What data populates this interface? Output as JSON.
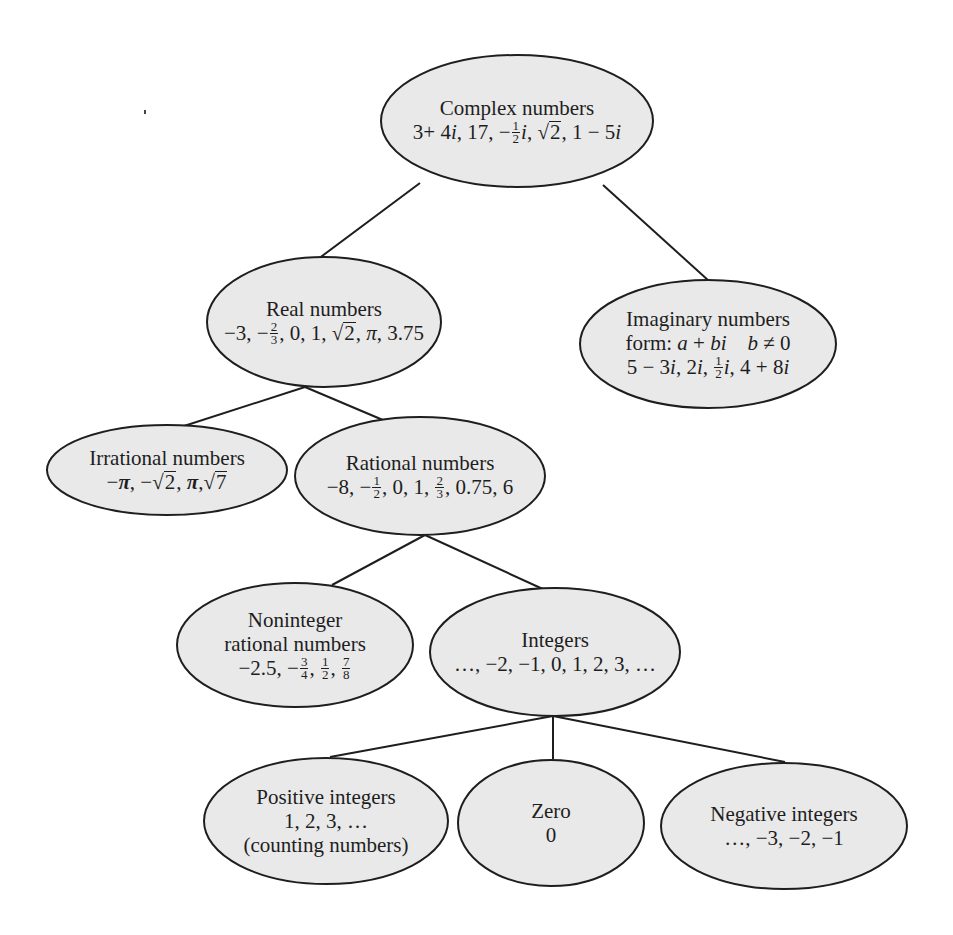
{
  "diagram": {
    "colors": {
      "node_fill": "#e9e9e9",
      "node_stroke": "#1e1e1e",
      "edge": "#1e1e1e",
      "background": "#ffffff"
    },
    "nodes": {
      "complex": {
        "label": "Complex numbers",
        "examples": "3+ 4i, 17, −½i, √2, 1 − 5i",
        "parts": {
          "a": "3+ 4",
          "i1": "i",
          "b": ", 17, −",
          "num": "1",
          "den": "2",
          "i2": "i",
          "c": ", ",
          "sqrt": "2",
          "d": ", 1 − 5",
          "i3": "i"
        }
      },
      "real": {
        "label": "Real numbers",
        "examples": "−3, −⅔, 0, 1, √2, π, 3.75",
        "parts": {
          "a": "−3, −",
          "num": "2",
          "den": "3",
          "b": ", 0, 1, ",
          "sqrt": "2",
          "c": ", ",
          "pi": "π",
          "d": ", 3.75"
        }
      },
      "imaginary": {
        "label": "Imaginary numbers",
        "form": "form: a + bi    b ≠ 0",
        "examples": "5 − 3i, 2i, ½i, 4 + 8i",
        "parts": {
          "form_prefix": "form: ",
          "form_a": "a",
          "form_plus": " + ",
          "form_bi": "bi",
          "form_gap": "    ",
          "form_b": "b",
          "form_neq": " ≠ 0",
          "e1": "5 − 3",
          "i1": "i",
          "e2": ", 2",
          "i2": "i",
          "e3": ", ",
          "num": "1",
          "den": "2",
          "i3": "i",
          "e4": ", 4 + 8",
          "i4": "i"
        }
      },
      "irrational": {
        "label": "Irrational numbers",
        "examples": "−π, −√2, π, √7",
        "parts": {
          "a": "−",
          "pi1": "π",
          "b": ", −",
          "sqrt1": "2",
          "c": ", ",
          "pi2": "π",
          "d": ",",
          "sqrt2": "7"
        }
      },
      "rational": {
        "label": "Rational numbers",
        "examples": "−8, −½, 0, 1, ⅔, 0.75, 6",
        "parts": {
          "a": "−8, −",
          "num1": "1",
          "den1": "2",
          "b": ", 0, 1, ",
          "num2": "2",
          "den2": "3",
          "c": ", 0.75, 6"
        }
      },
      "noninteger": {
        "label_line1": "Noninteger",
        "label_line2": "rational numbers",
        "examples": "−2.5, −¾, ½, ⅞",
        "parts": {
          "a": "−2.5, −",
          "num1": "3",
          "den1": "4",
          "b": ", ",
          "num2": "1",
          "den2": "2",
          "c": ", ",
          "num3": "7",
          "den3": "8"
        }
      },
      "integers": {
        "label": "Integers",
        "examples": "…, −2, −1, 0, 1, 2, 3, …"
      },
      "positive": {
        "label": "Positive integers",
        "examples": "1, 2, 3, …",
        "note": "(counting numbers)"
      },
      "zero": {
        "label": "Zero",
        "examples": "0"
      },
      "negative": {
        "label": "Negative integers",
        "examples": "…, −3, −2, −1"
      }
    },
    "edges": [
      {
        "from": "complex",
        "to": "real"
      },
      {
        "from": "complex",
        "to": "imaginary"
      },
      {
        "from": "real",
        "to": "irrational"
      },
      {
        "from": "real",
        "to": "rational"
      },
      {
        "from": "rational",
        "to": "noninteger"
      },
      {
        "from": "rational",
        "to": "integers"
      },
      {
        "from": "integers",
        "to": "positive"
      },
      {
        "from": "integers",
        "to": "zero"
      },
      {
        "from": "integers",
        "to": "negative"
      }
    ]
  }
}
